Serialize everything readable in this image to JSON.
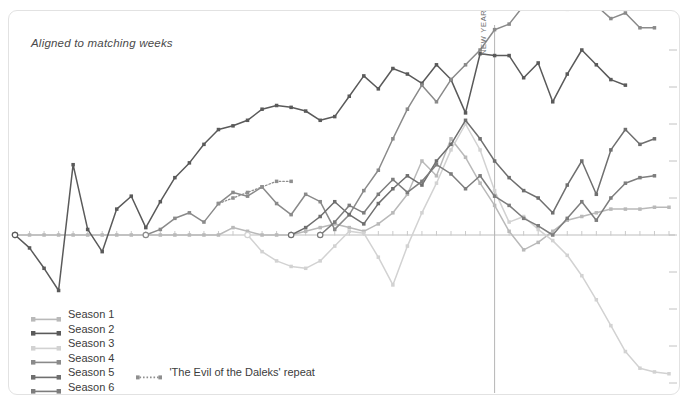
{
  "annotation": {
    "aligned_note": "Aligned to matching weeks",
    "new_year_label": "NEW YEAR"
  },
  "legend": {
    "items": [
      {
        "label": "Season 1",
        "color": "#b9b9b9",
        "style": "solid"
      },
      {
        "label": "Season 2",
        "color": "#5a5a5a",
        "style": "solid"
      },
      {
        "label": "Season 3",
        "color": "#d2d2d2",
        "style": "solid"
      },
      {
        "label": "Season 4",
        "color": "#8a8a8a",
        "style": "solid"
      },
      {
        "label": "Season 5",
        "color": "#6f6f6f",
        "style": "solid"
      },
      {
        "label": "Season 6",
        "color": "#7d7d7d",
        "style": "solid"
      },
      {
        "label": "Gap between episodes",
        "color": "#aeaeae",
        "style": "dashed"
      }
    ],
    "sub_item": {
      "label": "'The Evil of the Daleks' repeat",
      "color": "#8f8f8f",
      "style": "dotted"
    }
  },
  "chart_data": {
    "type": "line",
    "title": "",
    "subtitle": "Aligned to matching weeks",
    "xlabel": "",
    "ylabel": "",
    "grid": false,
    "legend_position": "bottom-left",
    "axis": {
      "baseline_y": 0,
      "new_year_x": 33,
      "x_ticks": 48,
      "y_right_ticks": 11
    },
    "annotations": [
      {
        "text": "NEW YEAR",
        "x": 33,
        "orientation": "vertical"
      },
      {
        "text": "Aligned to matching weeks",
        "x": 1,
        "y": 9.2
      }
    ],
    "series": [
      {
        "name": "Season 1",
        "color": "#b9b9b9",
        "x": [
          0,
          1,
          2,
          3,
          4,
          5,
          6,
          7,
          8,
          9,
          10,
          11,
          12,
          13,
          14,
          15,
          16,
          17,
          18,
          19,
          20,
          21,
          22,
          23,
          24,
          25,
          26,
          27,
          28,
          29,
          30,
          31,
          32,
          33,
          34,
          35,
          36,
          37,
          38,
          39,
          40,
          41,
          42,
          43,
          44,
          45
        ],
        "y": [
          0,
          0,
          0,
          0,
          0,
          0,
          0,
          0,
          0,
          0,
          0,
          0,
          0,
          0,
          0,
          0.2,
          0.1,
          0,
          0,
          0,
          0.1,
          0.2,
          0.3,
          0.2,
          0.1,
          0.3,
          0.6,
          1.1,
          2.0,
          1.6,
          2.6,
          2.1,
          1.4,
          0.8,
          0.1,
          -0.4,
          -0.2,
          0.1,
          0.4,
          0.5,
          0.6,
          0.7,
          0.7,
          0.7,
          0.75,
          0.75
        ]
      },
      {
        "name": "Season 2",
        "color": "#5a5a5a",
        "x": [
          0,
          1,
          2,
          3,
          4,
          5,
          6,
          7,
          8,
          9,
          10,
          11,
          12,
          13,
          14,
          15,
          16,
          17,
          18,
          19,
          20,
          21,
          22,
          23,
          24,
          25,
          26,
          27,
          28,
          29,
          30,
          31,
          32,
          33,
          34,
          35,
          36,
          37,
          38,
          39,
          40,
          41,
          42
        ],
        "y": [
          0,
          -0.35,
          -0.9,
          -1.5,
          1.9,
          0.15,
          -0.45,
          0.7,
          1.05,
          0.2,
          0.9,
          1.55,
          1.95,
          2.45,
          2.85,
          2.95,
          3.1,
          3.4,
          3.5,
          3.45,
          3.35,
          3.1,
          3.2,
          3.75,
          4.3,
          3.95,
          4.5,
          4.35,
          4.1,
          4.6,
          4.2,
          3.3,
          4.9,
          4.85,
          4.85,
          4.25,
          4.65,
          3.6,
          4.35,
          5.0,
          4.6,
          4.2,
          4.05
        ]
      },
      {
        "name": "Season 3",
        "color": "#d2d2d2",
        "x": [
          16,
          17,
          18,
          19,
          20,
          21,
          22,
          23,
          24,
          25,
          26,
          27,
          28,
          29,
          30,
          31,
          32,
          33,
          34,
          35,
          36,
          37,
          38,
          39,
          40,
          41,
          42,
          43,
          44,
          45
        ],
        "y": [
          0,
          -0.45,
          -0.7,
          -0.85,
          -0.9,
          -0.7,
          -0.3,
          0.1,
          0.05,
          -0.6,
          -1.35,
          -0.3,
          0.6,
          1.4,
          2.3,
          3.0,
          2.3,
          1.2,
          0.35,
          0.5,
          0.15,
          -0.15,
          -0.55,
          -1.1,
          -1.75,
          -2.45,
          -3.15,
          -3.6,
          -3.7,
          -3.75
        ]
      },
      {
        "name": "Season 4",
        "color": "#8a8a8a",
        "x": [
          9,
          10,
          11,
          12,
          13,
          14,
          15,
          16,
          17,
          18,
          19,
          20,
          21,
          22,
          23,
          24,
          25,
          26,
          27,
          28,
          29,
          30,
          31,
          32,
          33,
          34,
          35,
          36,
          37,
          38,
          39,
          40,
          41,
          42,
          43,
          44
        ],
        "y": [
          0,
          0.15,
          0.45,
          0.6,
          0.35,
          0.85,
          1.15,
          1.05,
          1.3,
          0.85,
          0.55,
          1.1,
          0.9,
          0.15,
          0.55,
          1.2,
          1.75,
          2.6,
          3.4,
          4.05,
          3.6,
          4.2,
          4.6,
          5.0,
          5.55,
          5.7,
          6.2,
          6.25,
          6.3,
          6.1,
          6.35,
          6.2,
          5.85,
          6.0,
          5.6,
          5.6
        ]
      },
      {
        "name": "Season 5",
        "color": "#6f6f6f",
        "x": [
          19,
          20,
          21,
          22,
          23,
          24,
          25,
          26,
          27,
          28,
          29,
          30,
          31,
          32,
          33,
          34,
          35,
          36,
          37,
          38,
          39,
          40,
          41,
          42,
          43,
          44
        ],
        "y": [
          0,
          0.2,
          0.5,
          0.9,
          0.55,
          0.3,
          0.85,
          1.25,
          1.6,
          1.35,
          2.0,
          2.45,
          3.1,
          2.6,
          2.0,
          1.55,
          1.2,
          1.0,
          0.6,
          1.35,
          2.0,
          1.1,
          2.3,
          2.85,
          2.45,
          2.6
        ]
      },
      {
        "name": "Season 6",
        "color": "#7d7d7d",
        "x": [
          21,
          22,
          23,
          24,
          25,
          26,
          27,
          28,
          29,
          30,
          31,
          32,
          33,
          34,
          35,
          36,
          37,
          38,
          39,
          40,
          41,
          42,
          43,
          44
        ],
        "y": [
          0,
          0.35,
          0.8,
          0.6,
          1.1,
          1.5,
          1.15,
          1.45,
          1.9,
          1.65,
          1.25,
          1.6,
          1.05,
          0.8,
          0.45,
          0.25,
          0.0,
          0.45,
          0.9,
          0.4,
          1.0,
          1.4,
          1.55,
          1.6
        ]
      },
      {
        "name": "'The Evil of the Daleks' repeat",
        "color": "#8f8f8f",
        "style": "dotted",
        "x": [
          14,
          15,
          16,
          17,
          18,
          19
        ],
        "y": [
          0.85,
          1.0,
          1.15,
          1.3,
          1.45,
          1.45
        ]
      },
      {
        "name": "Gap between episodes",
        "color": "#aeaeae",
        "style": "dashed",
        "x": [],
        "y": []
      }
    ]
  }
}
